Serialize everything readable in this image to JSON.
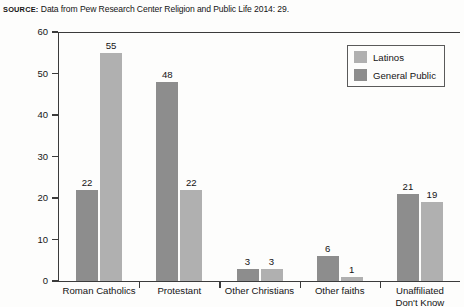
{
  "source": {
    "label": "SOURCE:",
    "text": " Data from Pew Research Center Religion and Public Life 2014: 29."
  },
  "legend": {
    "position": "top-right",
    "entries": [
      {
        "label": "Latinos",
        "color": "#b0b0b0",
        "swatch": "legend-swatch-latinos"
      },
      {
        "label": "General Public",
        "color": "#8d8d8d",
        "swatch": "legend-swatch-general-public"
      }
    ]
  },
  "axis": {
    "y_ticks": [
      "0",
      "10",
      "20",
      "30",
      "40",
      "50",
      "60"
    ]
  },
  "chart_data": {
    "type": "bar",
    "title": "",
    "subtitle": "",
    "xlabel": "",
    "ylabel": "",
    "ylim": [
      0,
      60
    ],
    "ytick_step": 10,
    "grid": false,
    "legend_position": "top-right",
    "categories": [
      "Roman Catholics",
      "Protestant",
      "Other Christians",
      "Other faiths",
      "Unaffiliated Don't Know"
    ],
    "category_lines": [
      [
        "Roman Catholics"
      ],
      [
        "Protestant"
      ],
      [
        "Other Christians"
      ],
      [
        "Other faiths"
      ],
      [
        "Unaffiliated",
        "Don't Know"
      ]
    ],
    "series": [
      {
        "name": "General Public",
        "color": "#8d8d8d",
        "values": [
          22,
          48,
          3,
          6,
          21
        ]
      },
      {
        "name": "Latinos",
        "color": "#b0b0b0",
        "values": [
          55,
          22,
          3,
          1,
          19
        ]
      }
    ],
    "annotations": [
      "SOURCE: Data from Pew Research Center Religion and Public Life 2014: 29."
    ]
  }
}
